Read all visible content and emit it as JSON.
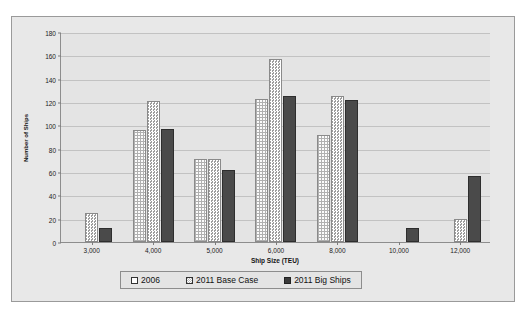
{
  "chart_data": {
    "type": "bar",
    "title": "",
    "xlabel": "Ship Size (TEU)",
    "ylabel": "Number of Ships",
    "categories": [
      "3,000",
      "4,000",
      "5,000",
      "6,000",
      "8,000",
      "10,000",
      "12,000"
    ],
    "series": [
      {
        "name": "2006",
        "values": [
          null,
          96,
          71,
          123,
          92,
          null,
          null
        ]
      },
      {
        "name": "2011 Base Case",
        "values": [
          25,
          121,
          71,
          157,
          125,
          null,
          20
        ]
      },
      {
        "name": "2011 Big Ships",
        "values": [
          12,
          97,
          62,
          125,
          122,
          12,
          57
        ]
      }
    ],
    "ylim": [
      0,
      180
    ],
    "yticks": [
      0,
      20,
      40,
      60,
      80,
      100,
      120,
      140,
      160,
      180
    ],
    "grid": true,
    "legend_position": "bottom"
  },
  "legend": {
    "items": [
      {
        "label": "2006"
      },
      {
        "label": "2011 Base Case"
      },
      {
        "label": "2011 Big Ships"
      }
    ]
  }
}
